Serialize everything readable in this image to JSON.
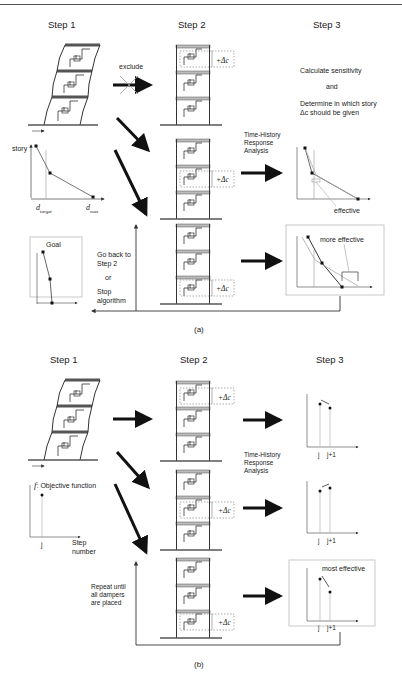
{
  "figure": {
    "panel_a": {
      "caption": "(a)",
      "steps": [
        "Step 1",
        "Step 2",
        "Step 3"
      ],
      "exclude_label": "exclude",
      "step1_graph": {
        "ylabel": "story",
        "xlabels": [
          "d_target",
          "d_max"
        ],
        "d_target_base": "d",
        "d_target_sub": "target",
        "d_max_base": "d",
        "d_max_sub": "max"
      },
      "goal_label": "Goal",
      "delta_c_label": "+Δc",
      "step3_text": {
        "line1": "Calculate sensitivity",
        "line2": "and",
        "line3": "Determine in which story",
        "line4": "Δc should be given"
      },
      "analysis_label": [
        "Time-History",
        "Response",
        "Analysis"
      ],
      "effective_label": "effective",
      "more_effective_label": "more effective",
      "loop_text": [
        "Go back to",
        "Step 2",
        "or",
        "Stop",
        "algorithm"
      ]
    },
    "panel_b": {
      "caption": "(b)",
      "steps": [
        "Step 1",
        "Step 2",
        "Step 3"
      ],
      "objective_label": "f",
      "objective_text": ": Objective function",
      "xaxis_label": [
        "Step",
        "number"
      ],
      "j_label": "j",
      "j1_label": "j+1",
      "delta_c_label": "+Δc",
      "analysis_label": [
        "Time-History",
        "Response",
        "Analysis"
      ],
      "most_effective_label": "most effective",
      "loop_text": [
        "Repeat until",
        "all dampers",
        "are placed"
      ]
    }
  }
}
